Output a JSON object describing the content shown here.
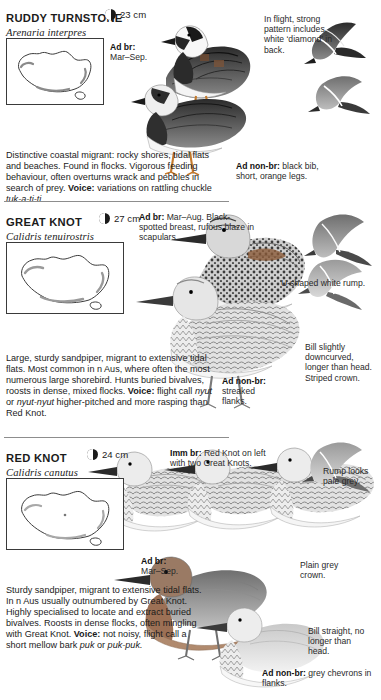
{
  "page": {
    "width": 381,
    "height": 700,
    "background": "#ffffff",
    "text_color": "#1b1b1b"
  },
  "species": [
    {
      "id": "ruddy-turnstone",
      "common_name": "RUDDY TURNSTONE",
      "scientific_name": "Arenaria interpres",
      "size_label": "23 cm",
      "size_icon": "half-circle-size-icon",
      "description_parts": [
        "Distinctive coastal migrant: rocky shores, tidal flats and beaches. Found in flocks. Vigorous feeding behaviour, often overturns wrack and pebbles in search of prey.",
        "Voice:",
        " variations on rattling chuckle ",
        "tuk-a-ti-ti."
      ],
      "callouts": [
        {
          "id": "ad-br",
          "bold": "Ad br:",
          "text": "Mar–Sep."
        },
        {
          "id": "in-flight",
          "bold": "",
          "text": "In flight, strong pattern includes white ‘diamond’ in back."
        },
        {
          "id": "ad-non-br",
          "bold": "Ad non-br:",
          "text": "black bib, short, orange legs."
        }
      ]
    },
    {
      "id": "great-knot",
      "common_name": "GREAT KNOT",
      "scientific_name": "Calidris tenuirostris",
      "size_label": "27 cm",
      "size_icon": "half-circle-size-icon",
      "description_parts": [
        "Large, sturdy sandpiper, migrant to extensive tidal flats. Most common in n Aus, where often the most numerous large shorebird. Hunts buried bivalves, roosts in dense, mixed flocks.",
        "Voice:",
        " flight call ",
        "nyut",
        " or ",
        "nyut-nyut",
        " higher-pitched and more rasping than Red Knot."
      ],
      "callouts": [
        {
          "id": "ad-br",
          "bold": "Ad br:",
          "text": "Mar–Aug. Black-spotted breast, rufous blaze in scapulars."
        },
        {
          "id": "rump",
          "bold": "",
          "text": "U-shaped white rump."
        },
        {
          "id": "bill",
          "bold": "",
          "text": "Bill slightly downcurved, longer than head. Striped crown."
        },
        {
          "id": "ad-non-br",
          "bold": "Ad non-br:",
          "text": "streaked flanks."
        }
      ]
    },
    {
      "id": "red-knot",
      "common_name": "RED KNOT",
      "scientific_name": "Calidris canutus",
      "size_label": "24 cm",
      "size_icon": "half-circle-size-icon",
      "description_parts": [
        "Sturdy sandpiper, migrant to extensive tidal flats. In n Aus usually outnumbered by Great Knot. Highly specialised to locate and extract buried bivalves. Roosts in dense flocks, often mingling with Great Knot.",
        "Voice:",
        " not noisy, flight call a short mellow bark ",
        "puk",
        " or ",
        "puk-puk."
      ],
      "callouts": [
        {
          "id": "imm-br",
          "bold": "Imm br:",
          "text": "Red Knot on left with two Great Knots."
        },
        {
          "id": "rump",
          "bold": "",
          "text": "Rump looks pale grey."
        },
        {
          "id": "ad-br",
          "bold": "Ad br:",
          "text": "Mar–Sep."
        },
        {
          "id": "crown",
          "bold": "",
          "text": "Plain grey crown."
        },
        {
          "id": "bill",
          "bold": "",
          "text": "Bill straight, no longer than head."
        },
        {
          "id": "ad-non-br",
          "bold": "Ad non-br:",
          "text": "grey chevrons in flanks."
        }
      ]
    }
  ],
  "map": {
    "label": "australia-distribution-map",
    "border_color": "#3a3a3a",
    "fill_color": "#ffffff"
  }
}
